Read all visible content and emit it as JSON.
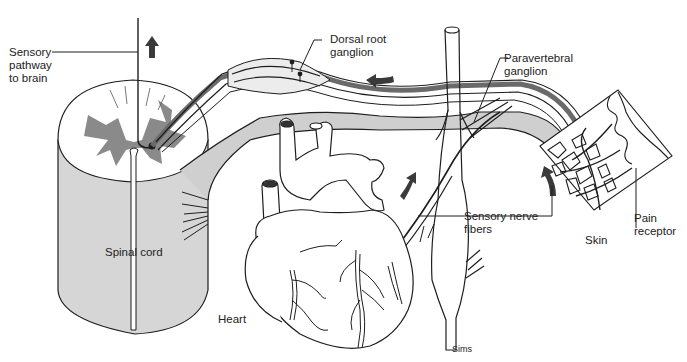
{
  "figure": {
    "title_cutoff": "",
    "labels": {
      "sensory_pathway": "Sensory\npathway\nto brain",
      "dorsal_root_ganglion": "Dorsal root\nganglion",
      "paravertebral_ganglion": "Paravertebral\nganglion",
      "sensory_nerve_fibers": "Sensory nerve\nfibers",
      "pain_receptor": "Pain\nreceptor",
      "skin": "Skin",
      "spinal_cord": "Spinal cord",
      "heart": "Heart",
      "credit": "Sims"
    },
    "colors": {
      "line": "#1e1e1e",
      "gray_matter": "#8a8a8a",
      "cord_side": "#d6d6d6",
      "nerve_fill": "#cfcfcf",
      "arrow": "#3a3a3a",
      "label_text": "#222222"
    },
    "arrows": [
      {
        "name": "ascending-arrow",
        "direction": "up"
      },
      {
        "name": "afferent-arrow-top",
        "direction": "left"
      },
      {
        "name": "afferent-arrow-heart",
        "direction": "up-right"
      },
      {
        "name": "afferent-arrow-skin",
        "direction": "up-left"
      }
    ]
  }
}
